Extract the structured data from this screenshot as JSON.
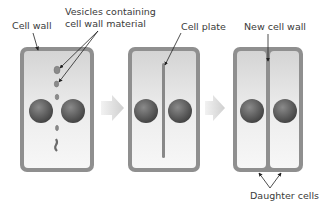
{
  "labels": {
    "cell_wall": "Cell wall",
    "vesicles_line1": "Vesicles containing",
    "vesicles_line2": "cell wall material",
    "cell_plate": "Cell plate",
    "new_cell_wall": "New cell wall",
    "daughter_cells": "Daughter cells"
  },
  "stages": [
    {
      "id": "stage-1",
      "description": "Vesicles containing cell wall material gather at the equator"
    },
    {
      "id": "stage-2",
      "description": "Vesicles fuse into a cell plate"
    },
    {
      "id": "stage-3",
      "description": "Cell plate becomes new cell wall separating two daughter cells"
    }
  ],
  "colors": {
    "wall": "#8f8f8f",
    "cytoplasm_light": "#f4f4f4",
    "cytoplasm_dark": "#d6d6d6",
    "nucleus_light": "#9a9a9a",
    "nucleus_dark": "#4a4a4a",
    "arrow": "#dcdcdc",
    "text": "#3a3a3a"
  }
}
